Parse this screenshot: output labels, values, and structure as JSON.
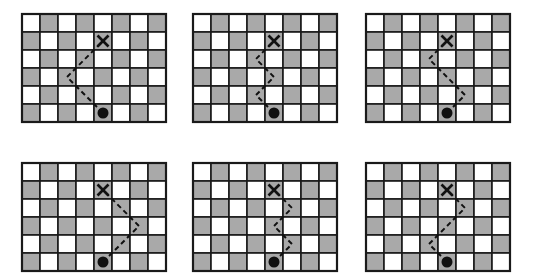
{
  "figure": {
    "grid": {
      "cols": 8,
      "rows": 6,
      "cell_size": 18,
      "light_color": "#ffffff",
      "dark_color": "#a9a9a9",
      "line_color": "#1a1a1a",
      "top_left": "light"
    },
    "start_marker": {
      "type": "dot",
      "col": 4.5,
      "row": 5.5
    },
    "end_marker": {
      "type": "x",
      "col": 4.5,
      "row": 1.5
    },
    "panels": [
      {
        "id": "panel-1",
        "x": 22,
        "y": 14,
        "path": [
          [
            4.5,
            5.5
          ],
          [
            2.5,
            3.5
          ],
          [
            4.5,
            1.5
          ]
        ]
      },
      {
        "id": "panel-2",
        "x": 193,
        "y": 14,
        "path": [
          [
            4.5,
            5.5
          ],
          [
            3.5,
            4.5
          ],
          [
            4.5,
            3.5
          ],
          [
            3.5,
            2.5
          ],
          [
            4.5,
            1.5
          ]
        ]
      },
      {
        "id": "panel-3",
        "x": 366,
        "y": 14,
        "path": [
          [
            4.5,
            5.5
          ],
          [
            5.5,
            4.5
          ],
          [
            3.5,
            2.5
          ],
          [
            4.5,
            1.5
          ]
        ]
      },
      {
        "id": "panel-4",
        "x": 22,
        "y": 163,
        "path": [
          [
            4.5,
            5.5
          ],
          [
            6.5,
            3.5
          ],
          [
            4.5,
            1.5
          ]
        ]
      },
      {
        "id": "panel-5",
        "x": 193,
        "y": 163,
        "path": [
          [
            4.5,
            5.5
          ],
          [
            5.5,
            4.5
          ],
          [
            4.5,
            3.5
          ],
          [
            5.5,
            2.5
          ],
          [
            4.5,
            1.5
          ]
        ]
      },
      {
        "id": "panel-6",
        "x": 366,
        "y": 163,
        "path": [
          [
            4.5,
            5.5
          ],
          [
            3.5,
            4.5
          ],
          [
            5.5,
            2.5
          ],
          [
            4.5,
            1.5
          ]
        ]
      }
    ]
  }
}
